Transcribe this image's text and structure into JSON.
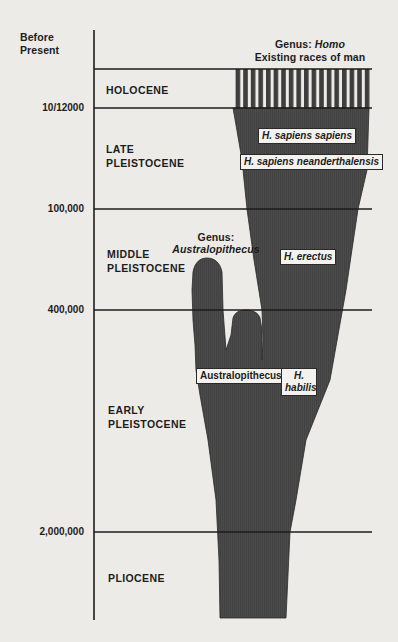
{
  "axis": {
    "title_line1": "Before",
    "title_line2": "Present",
    "ticks": [
      {
        "label": "10/12000"
      },
      {
        "label": "100,000"
      },
      {
        "label": "400,000"
      },
      {
        "label": "2,000,000"
      }
    ]
  },
  "epochs": [
    {
      "line1": "HOLOCENE",
      "line2": ""
    },
    {
      "line1": "LATE",
      "line2": "PLEISTOCENE"
    },
    {
      "line1": "MIDDLE",
      "line2": "PLEISTOCENE"
    },
    {
      "line1": "EARLY",
      "line2": "PLEISTOCENE"
    },
    {
      "line1": "PLIOCENE",
      "line2": ""
    }
  ],
  "genera": {
    "homo": {
      "prefix": "Genus: ",
      "name": "Homo",
      "subtitle": "Existing races of man"
    },
    "australopithecus": {
      "prefix": "Genus:",
      "name": "Australopithecus"
    }
  },
  "species_labels": {
    "sapiens_sapiens": "H. sapiens sapiens",
    "neanderthalensis": "H. sapiens neanderthalensis",
    "erectus": "H. erectus",
    "australopithecus": "Australopithecus",
    "habilis_line1": "H.",
    "habilis_line2": "habilis"
  },
  "colors": {
    "background": "#ecebe7",
    "fill": "#4a4a4a",
    "line": "#1c1c1c"
  }
}
